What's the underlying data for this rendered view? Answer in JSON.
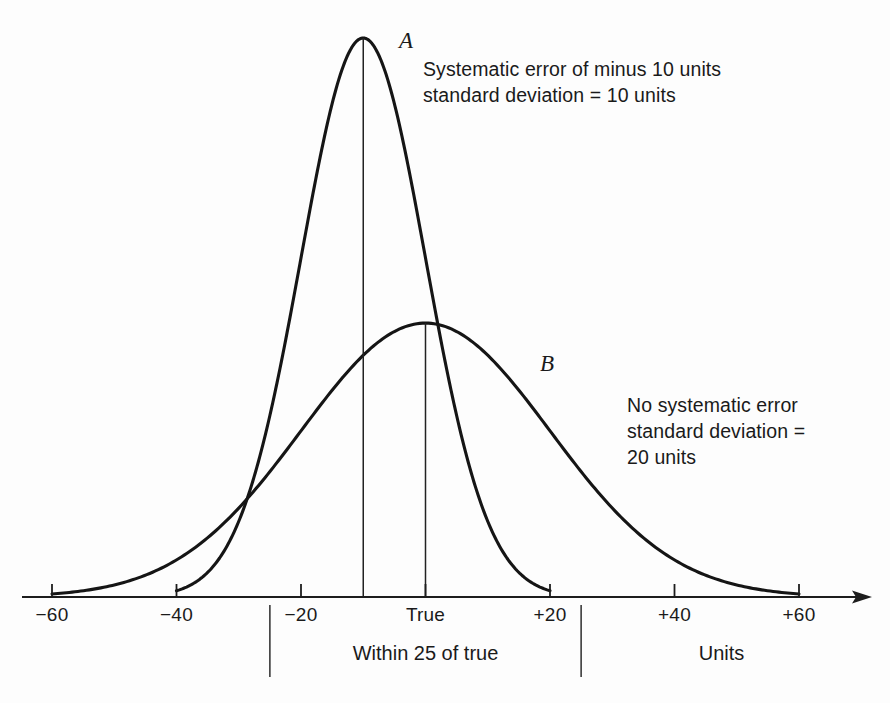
{
  "figure": {
    "background_color": "#fdfdfd",
    "ink_color": "#1a1a1a"
  },
  "annotations": {
    "curve_a_note": "Systematic error of minus 10 units\nstandard deviation = 10 units",
    "curve_b_note": "No systematic error\nstandard deviation =\n20 units",
    "curve_a_label": "A",
    "curve_b_label": "B",
    "band_label": "Within 25 of true",
    "axis_units_label": "Units"
  },
  "chart_data": {
    "type": "line",
    "title": "",
    "subtitle": "",
    "xlabel": "Units",
    "ylabel": "",
    "grid": false,
    "legend_position": "inline-annotations",
    "xlim": [
      -65,
      68
    ],
    "ylim": [
      0,
      1.05
    ],
    "x_ticks": [
      -60,
      -40,
      -20,
      0,
      20,
      40,
      60
    ],
    "x_tick_labels": [
      "−60",
      "−40",
      "−20",
      "True",
      "+20",
      "+40",
      "+60"
    ],
    "series": [
      {
        "name": "A",
        "label": "A",
        "mean": -10,
        "std_dev": 10,
        "peak_height": 1.0,
        "domain": [
          -40,
          20
        ],
        "note": "Systematic error of minus 10 units, standard deviation = 10 units",
        "peak_marker_line": true,
        "peak_marker_x": -10
      },
      {
        "name": "B",
        "label": "B",
        "mean": 0,
        "std_dev": 20,
        "peak_height": 0.49,
        "domain": [
          -60,
          60
        ],
        "note": "No systematic error, standard deviation = 20 units",
        "peak_marker_line": true,
        "peak_marker_x": 0
      }
    ],
    "bands": [
      {
        "label": "Within 25 of true",
        "from": -25,
        "to": 25
      }
    ],
    "annotations_text": [
      "Systematic error of minus 10 units",
      "standard deviation = 10 units",
      "No systematic error",
      "standard deviation =",
      "20 units",
      "Within 25 of true",
      "Units"
    ]
  }
}
